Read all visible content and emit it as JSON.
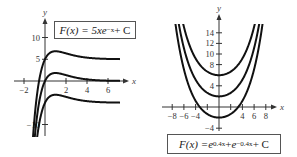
{
  "chart_data": [
    {
      "type": "line",
      "title": "F(x) = 5xe^{-x} + C",
      "formula": {
        "lhs": "F(x) = 5x",
        "base": "e",
        "exp": "−x",
        "tail": " + C"
      },
      "xlabel": "x",
      "ylabel": "y",
      "xlim": [
        -3,
        7.5
      ],
      "ylim": [
        -12,
        14
      ],
      "x_ticks": [
        -2,
        2,
        4,
        6
      ],
      "y_ticks": [
        10,
        5,
        -10
      ],
      "grid": false,
      "function": "5*x*exp(-x) + C",
      "series": [
        {
          "name": "C = 5",
          "C": 5
        },
        {
          "name": "C = 0",
          "C": 0
        },
        {
          "name": "C = -5",
          "C": -5
        }
      ]
    },
    {
      "type": "line",
      "title": "F(x) = e^{0.4x} + e^{-0.4x} + C",
      "formula": {
        "lhs": "F(x) = ",
        "base1": "e",
        "exp1": "0.4x",
        "mid": " + ",
        "base2": "e",
        "exp2": "−0.4x",
        "tail": " + C"
      },
      "xlabel": "x",
      "ylabel": "y",
      "xlim": [
        -9.5,
        10
      ],
      "ylim": [
        -5,
        16
      ],
      "x_ticks": [
        -8,
        -6,
        -4,
        4,
        6,
        8
      ],
      "y_ticks": [
        14,
        12,
        10,
        8,
        4,
        -4
      ],
      "grid": false,
      "function": "exp(0.4*x) + exp(-0.4*x) + C",
      "series": [
        {
          "name": "C = 4",
          "C": 4
        },
        {
          "name": "C = 0",
          "C": 0
        },
        {
          "name": "C = -4",
          "C": -4
        }
      ]
    }
  ]
}
